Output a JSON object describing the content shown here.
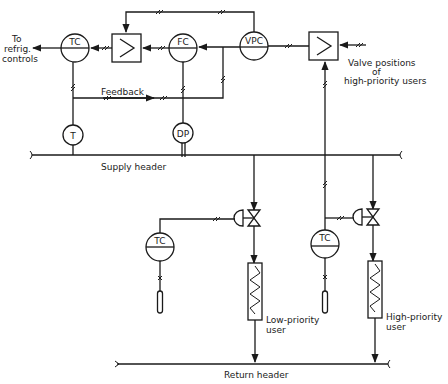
{
  "diagram": {
    "type": "process-control-schematic",
    "colors": {
      "ink": "#1a1a1a",
      "background": "#ffffff"
    },
    "instruments": {
      "tc_main": "TC",
      "fc": "FC",
      "vpc": "VPC",
      "t": "T",
      "dp": "DP",
      "tc_low": "TC",
      "tc_high": "TC"
    },
    "selectors": {
      "high_select_1": ">",
      "high_select_2": ">"
    },
    "labels": {
      "to_refrig_line1": "To",
      "to_refrig_line2": "refrig.",
      "to_refrig_line3": "controls",
      "feedback": "Feedback",
      "valve_positions_line1": "Valve positions",
      "valve_positions_line2": "of",
      "valve_positions_line3": "high-priority users",
      "supply_header": "Supply header",
      "return_header": "Return header",
      "low_priority_line1": "Low-priority",
      "low_priority_line2": "user",
      "high_priority_line1": "High-priority",
      "high_priority_line2": "user"
    }
  }
}
